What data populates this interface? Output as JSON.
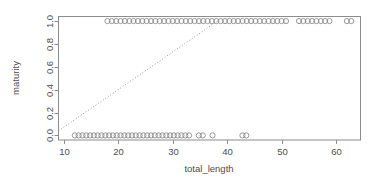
{
  "chart_data": {
    "type": "scatter",
    "title": "",
    "xlabel": "total_length",
    "ylabel": "maturity",
    "xlim": [
      9.0,
      64.5
    ],
    "ylim": [
      -0.04,
      1.04
    ],
    "grid": false,
    "legend": null,
    "xticks": [
      10,
      20,
      30,
      40,
      50,
      60
    ],
    "xtick_labels": [
      "10",
      "20",
      "30",
      "40",
      "50",
      "60"
    ],
    "yticks": [
      0.0,
      0.2,
      0.4,
      0.6,
      0.8,
      1.0
    ],
    "ytick_labels": [
      "0.0",
      "0.2",
      "0.4",
      "0.6",
      "0.8",
      "1.0"
    ],
    "point_style": {
      "marker": "open-circle",
      "radius": 2.6,
      "color": "#8c8c8c",
      "fill": "none"
    },
    "series": [
      {
        "name": "maturity = 0",
        "y": 0.0,
        "x": [
          12.0,
          12.7,
          13.4,
          14.1,
          14.8,
          15.5,
          16.2,
          16.9,
          17.6,
          18.3,
          19.0,
          19.7,
          20.4,
          21.1,
          21.8,
          22.5,
          23.2,
          23.9,
          24.6,
          25.3,
          26.0,
          26.7,
          27.4,
          28.1,
          28.8,
          29.5,
          30.2,
          30.9,
          31.6,
          32.3,
          33.0,
          34.8,
          35.5,
          37.3,
          42.8,
          43.5
        ]
      },
      {
        "name": "maturity = 1",
        "y": 1.0,
        "x": [
          18.0,
          18.8,
          19.6,
          20.4,
          21.2,
          22.0,
          22.8,
          23.6,
          24.4,
          25.2,
          26.0,
          26.8,
          27.6,
          28.4,
          29.2,
          30.0,
          30.8,
          31.6,
          32.4,
          33.2,
          34.0,
          34.8,
          35.6,
          36.4,
          37.2,
          38.0,
          38.8,
          39.6,
          40.4,
          41.2,
          42.0,
          42.8,
          43.6,
          44.4,
          45.2,
          46.0,
          46.8,
          47.6,
          48.4,
          49.2,
          50.0,
          50.8,
          53.2,
          54.0,
          54.8,
          55.6,
          56.4,
          57.2,
          58.0,
          58.8,
          62.0,
          62.8
        ]
      }
    ],
    "fit_line": {
      "name": "linear-fit",
      "style": "dotted",
      "color": "#9a9a9a",
      "x_start": 9.0,
      "y_start": 0.04,
      "x_end": 38.2,
      "y_end": 1.0
    },
    "box": {
      "color": "#8c8c8c",
      "visible_sides": [
        "left",
        "right",
        "top",
        "bottom"
      ]
    }
  }
}
